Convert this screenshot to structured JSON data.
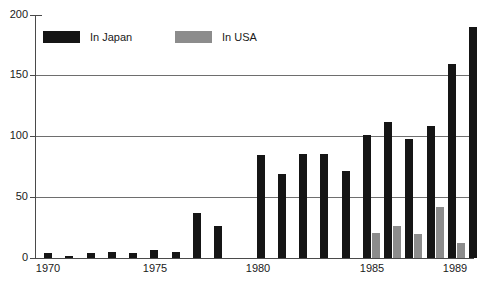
{
  "chart_data": {
    "type": "bar",
    "title": "",
    "subtitle": "",
    "xlabel": "",
    "ylabel": "",
    "ylim": [
      0,
      200
    ],
    "yticks": [
      0,
      50,
      100,
      150,
      200
    ],
    "ytick_labels": [
      "0",
      "50",
      "100",
      "150",
      "200"
    ],
    "grid": "horizontal",
    "legend_position": "top-left-inside",
    "categories": [
      "1970",
      "1971",
      "1972",
      "1973",
      "1974",
      "1975",
      "1976",
      "1977",
      "1978",
      "1979",
      "1980",
      "1981",
      "1982",
      "1983",
      "1984",
      "1985",
      "1986",
      "1987",
      "1988",
      "1989"
    ],
    "xtick_labels_shown": [
      "1970",
      "1975",
      "1980",
      "1985",
      "1989"
    ],
    "series": [
      {
        "name": "In Japan",
        "color": "#151515",
        "values": [
          4,
          2,
          4,
          5,
          4,
          7,
          5,
          37,
          26,
          0,
          85,
          69,
          86,
          86,
          72,
          101,
          112,
          98,
          109,
          160
        ]
      },
      {
        "name": "In USA",
        "color": "#8c8c8c",
        "values": [
          0,
          0,
          0,
          0,
          0,
          0,
          0,
          0,
          0,
          0,
          0,
          0,
          0,
          0,
          0,
          21,
          26,
          20,
          42,
          12
        ]
      }
    ],
    "extra_bar": {
      "name": "In Japan",
      "category": "1989",
      "value": 190
    }
  },
  "legend": {
    "entries": [
      {
        "label": "In Japan",
        "color": "#151515"
      },
      {
        "label": "In USA",
        "color": "#8c8c8c"
      }
    ]
  },
  "axes": {
    "y_tick_labels": [
      "200",
      "150",
      "100",
      "50",
      "0"
    ],
    "x_tick_labels": [
      "1970",
      "1975",
      "1980",
      "1985",
      "1989"
    ]
  },
  "colors": {
    "japan": "#151515",
    "usa": "#8c8c8c",
    "grid": "#6e6e6e",
    "axis": "#4a4a4a",
    "text": "#1a1a1a",
    "background": "#ffffff"
  }
}
